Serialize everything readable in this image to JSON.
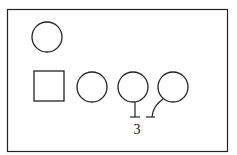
{
  "diagram": {
    "type": "pedigree",
    "stroke_color": "#222222",
    "background": "#ffffff",
    "frame": {
      "x": 7.5,
      "y": 9.5,
      "width": 220,
      "height": 142
    },
    "symbols": [
      {
        "id": "female-1",
        "shape": "circle",
        "cx": 47,
        "cy": 37,
        "r": 15
      },
      {
        "id": "male-1",
        "shape": "square",
        "x": 34,
        "y": 71,
        "width": 30,
        "height": 30
      },
      {
        "id": "female-2",
        "shape": "circle",
        "cx": 92,
        "cy": 87,
        "r": 15
      },
      {
        "id": "female-3",
        "shape": "circle",
        "cx": 133,
        "cy": 87,
        "r": 15
      },
      {
        "id": "female-4",
        "shape": "circle",
        "cx": 173,
        "cy": 87,
        "r": 15
      }
    ],
    "twin_label": "3"
  }
}
